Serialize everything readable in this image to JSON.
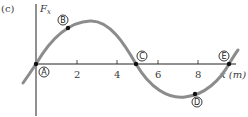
{
  "figure": {
    "panel_label": "(c)",
    "y_axis_label": "F",
    "y_axis_subscript": "x",
    "x_axis_label": "x (m)",
    "curve_color": "#8c8c8c",
    "axis_color": "#222222"
  },
  "ticks": [
    {
      "label": "2",
      "value": 2
    },
    {
      "label": "4",
      "value": 4
    },
    {
      "label": "6",
      "value": 6
    },
    {
      "label": "8",
      "value": 8
    }
  ],
  "points": [
    {
      "label": "A",
      "x": 0.0,
      "description": "zero crossing at origin"
    },
    {
      "label": "B",
      "x": 1.5,
      "description": "on rising curve, positive"
    },
    {
      "label": "C",
      "x": 4.9,
      "description": "zero crossing"
    },
    {
      "label": "D",
      "x": 7.8,
      "description": "near minimum, negative"
    },
    {
      "label": "E",
      "x": 9.6,
      "description": "zero crossing"
    }
  ]
}
